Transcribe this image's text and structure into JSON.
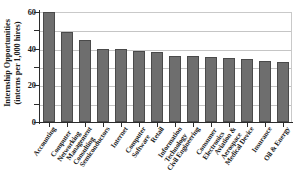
{
  "chart_data": {
    "type": "bar",
    "title": "",
    "xlabel": "",
    "ylabel": "Internship Opportunities (interns per 1,000 hires)",
    "ylabel_line1": "Internship Opportunities",
    "ylabel_line2": "(interns per 1,000 hires)",
    "ylim": [
      0,
      60
    ],
    "ytick_labels": [
      "0",
      "20",
      "40",
      "60"
    ],
    "ytick_values": [
      0,
      20,
      40,
      60
    ],
    "minor_tick_values": [
      10,
      30,
      50
    ],
    "gridlines": [
      10,
      20,
      30,
      40,
      50,
      60
    ],
    "grid": true,
    "legend": "none",
    "bar_color": "#6e6e6e",
    "bar_edge_color": "#4a4a4a",
    "axis_color": "#2b2b2b",
    "grid_color": "#c5c5c5",
    "categories": [
      "Accounting",
      "Computer Networking",
      "Management Consulting",
      "Semiconductors",
      "Internet",
      "Computer Software",
      "Retail",
      "Information Technology",
      "Civil Engineering",
      "Consumer Electronics",
      "Aviation & Aerospace",
      "Medical Device",
      "Insurance",
      "Oil & Energy"
    ],
    "category_lines": [
      [
        "Accounting"
      ],
      [
        "Computer",
        "Networking"
      ],
      [
        "Management",
        "Consulting"
      ],
      [
        "Semiconductors"
      ],
      [
        "Internet"
      ],
      [
        "Computer",
        "Software"
      ],
      [
        "Retail"
      ],
      [
        "Information",
        "Technology"
      ],
      [
        "Civil Engineering"
      ],
      [
        "Consumer",
        "Electronics"
      ],
      [
        "Aviation &",
        "Aerospace"
      ],
      [
        "Medical Device"
      ],
      [
        "Insurance"
      ],
      [
        "Oil & Energy"
      ]
    ],
    "values": [
      60,
      49,
      45,
      40,
      40,
      38.5,
      38,
      36,
      36,
      35.5,
      35,
      34.5,
      33.5,
      33
    ]
  }
}
